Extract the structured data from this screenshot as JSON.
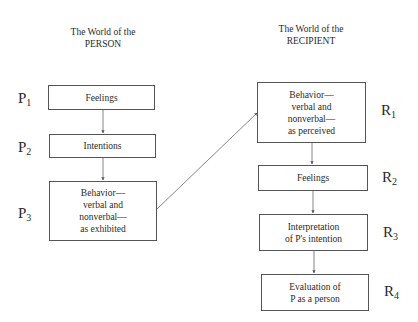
{
  "diagram": {
    "person": {
      "title_line1": "The World of the",
      "title_line2": "PERSON",
      "steps": [
        {
          "label": "P",
          "sub": "1",
          "text": "Feelings"
        },
        {
          "label": "P",
          "sub": "2",
          "text": "Intentions"
        },
        {
          "label": "P",
          "sub": "3",
          "text": "Behavior—\nverbal and\nnonverbal—\nas exhibited"
        }
      ]
    },
    "recipient": {
      "title_line1": "The World of the",
      "title_line2": "RECIPIENT",
      "steps": [
        {
          "label": "R",
          "sub": "1",
          "text": "Behavior—\nverbal and\nnonverbal—\nas perceived"
        },
        {
          "label": "R",
          "sub": "2",
          "text": "Feelings"
        },
        {
          "label": "R",
          "sub": "3",
          "text": "Interpretation\nof P's intention"
        },
        {
          "label": "R",
          "sub": "4",
          "text": "Evaluation of\nP as a person"
        }
      ]
    },
    "connections": [
      {
        "from": "P1",
        "to": "P2"
      },
      {
        "from": "P2",
        "to": "P3"
      },
      {
        "from": "P3",
        "to": "R1"
      },
      {
        "from": "R1",
        "to": "R2"
      },
      {
        "from": "R2",
        "to": "R3"
      },
      {
        "from": "R3",
        "to": "R4"
      }
    ]
  }
}
